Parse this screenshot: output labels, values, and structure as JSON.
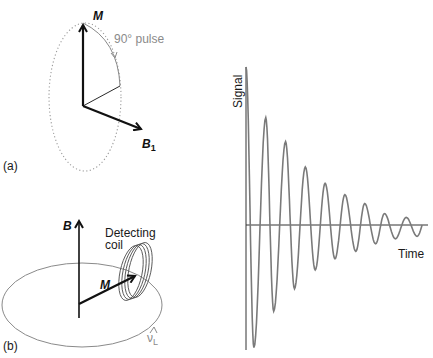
{
  "figure": {
    "panel_a": {
      "panel_label": "(a)",
      "magnetization_label": "M",
      "field_label": "B",
      "field_subscript": "1",
      "pulse_label": "90°  pulse"
    },
    "panel_b": {
      "panel_label": "(b)",
      "field_label": "B",
      "magnetization_label": "M",
      "coil_label_line1": "Detecting",
      "coil_label_line2": "coil",
      "frequency_label": "ν",
      "frequency_subscript": "L"
    },
    "colors": {
      "ink": "#111111",
      "gray_line": "#8a8a8a",
      "signal": "#7a7a7a"
    }
  },
  "chart_data": {
    "type": "line",
    "title": "",
    "xlabel": "Time",
    "ylabel": "Signal",
    "xlim": [
      0,
      9.2
    ],
    "ylim": [
      -1.0,
      1.25
    ],
    "grid": false,
    "series": [
      {
        "name": "FID",
        "peaks": [
          {
            "t": 0.0,
            "v": 1.25
          },
          {
            "t": 1.0,
            "v": 0.85
          },
          {
            "t": 2.0,
            "v": 0.66
          },
          {
            "t": 3.0,
            "v": 0.46
          },
          {
            "t": 4.0,
            "v": 0.33
          },
          {
            "t": 5.0,
            "v": 0.24
          },
          {
            "t": 6.0,
            "v": 0.17
          },
          {
            "t": 7.0,
            "v": 0.09
          },
          {
            "t": 8.1,
            "v": 0.06
          }
        ],
        "troughs": [
          {
            "t": 0.4,
            "v": -0.98
          },
          {
            "t": 1.4,
            "v": -0.69
          },
          {
            "t": 2.45,
            "v": -0.51
          },
          {
            "t": 3.5,
            "v": -0.36
          },
          {
            "t": 4.5,
            "v": -0.27
          },
          {
            "t": 5.55,
            "v": -0.21
          },
          {
            "t": 6.55,
            "v": -0.15
          },
          {
            "t": 7.55,
            "v": -0.11
          },
          {
            "t": 8.65,
            "v": -0.09
          }
        ]
      }
    ]
  }
}
